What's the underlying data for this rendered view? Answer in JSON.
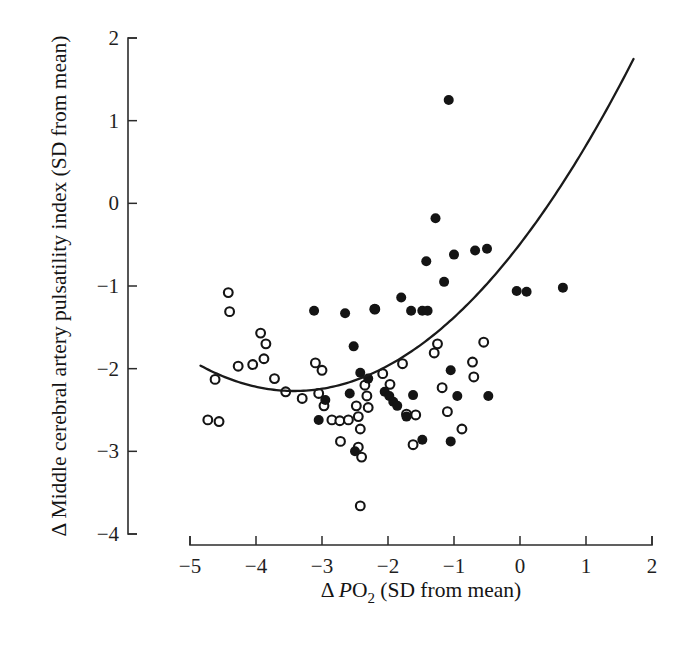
{
  "chart_data": {
    "type": "scatter",
    "title": "",
    "xlabel": "Δ PO2 (SD from mean)",
    "xlabel_parts": {
      "delta": "Δ",
      "italic": "P",
      "roman": "O",
      "sub": "2",
      "tail": " (SD from mean)"
    },
    "ylabel": "Δ Middle cerebral artery pulsatility index (SD from mean)",
    "xlim": [
      -5,
      2
    ],
    "ylim": [
      -4,
      2
    ],
    "xticks": [
      -5,
      -4,
      -3,
      -2,
      -1,
      0,
      1,
      2
    ],
    "xtick_labels": [
      "−5",
      "−4",
      "−3",
      "−2",
      "−1",
      "0",
      "1",
      "2"
    ],
    "yticks": [
      2,
      1,
      0,
      -1,
      -2,
      -3,
      -4
    ],
    "ytick_labels": [
      "2",
      "1",
      "0",
      "−1",
      "−2",
      "−3",
      "−4"
    ],
    "grid": false,
    "legend": false,
    "marker_colors": {
      "filled": "#141414",
      "open_fill": "#ffffff",
      "open_stroke": "#141414",
      "curve": "#1a1a1a",
      "axis": "#2b2b2b"
    },
    "series": [
      {
        "name": "open-circles",
        "marker": "open",
        "points": [
          [
            -4.42,
            -1.08
          ],
          [
            -4.4,
            -1.31
          ],
          [
            -3.93,
            -1.57
          ],
          [
            -3.85,
            -1.7
          ],
          [
            -3.88,
            -1.88
          ],
          [
            -4.27,
            -1.97
          ],
          [
            -4.05,
            -1.95
          ],
          [
            -3.72,
            -2.12
          ],
          [
            -3.55,
            -2.28
          ],
          [
            -4.62,
            -2.13
          ],
          [
            -3.3,
            -2.36
          ],
          [
            -4.73,
            -2.62
          ],
          [
            -4.56,
            -2.64
          ],
          [
            -3.1,
            -1.93
          ],
          [
            -3.0,
            -2.02
          ],
          [
            -3.05,
            -2.3
          ],
          [
            -2.97,
            -2.45
          ],
          [
            -2.85,
            -2.62
          ],
          [
            -2.73,
            -2.63
          ],
          [
            -2.6,
            -2.62
          ],
          [
            -2.48,
            -2.45
          ],
          [
            -2.45,
            -2.58
          ],
          [
            -2.42,
            -2.73
          ],
          [
            -2.35,
            -2.2
          ],
          [
            -2.32,
            -2.33
          ],
          [
            -2.3,
            -2.47
          ],
          [
            -2.72,
            -2.88
          ],
          [
            -2.45,
            -2.95
          ],
          [
            -2.4,
            -3.07
          ],
          [
            -2.42,
            -3.66
          ],
          [
            -2.2,
            -1.28
          ],
          [
            -2.08,
            -2.06
          ],
          [
            -1.97,
            -2.19
          ],
          [
            -1.78,
            -1.94
          ],
          [
            -1.72,
            -2.55
          ],
          [
            -1.58,
            -2.56
          ],
          [
            -1.62,
            -2.92
          ],
          [
            -1.3,
            -1.81
          ],
          [
            -1.25,
            -1.7
          ],
          [
            -1.18,
            -2.23
          ],
          [
            -1.1,
            -2.52
          ],
          [
            -0.88,
            -2.73
          ],
          [
            -0.72,
            -1.92
          ],
          [
            -0.7,
            -2.1
          ],
          [
            -0.55,
            -1.68
          ]
        ]
      },
      {
        "name": "filled-circles",
        "marker": "filled",
        "points": [
          [
            -1.08,
            1.25
          ],
          [
            -1.28,
            -0.18
          ],
          [
            -1.42,
            -0.7
          ],
          [
            -1.0,
            -0.62
          ],
          [
            -0.68,
            -0.57
          ],
          [
            -0.5,
            -0.55
          ],
          [
            -1.15,
            -0.95
          ],
          [
            -2.65,
            -1.33
          ],
          [
            -2.2,
            -1.28
          ],
          [
            -1.8,
            -1.14
          ],
          [
            -1.65,
            -1.3
          ],
          [
            -1.48,
            -1.3
          ],
          [
            -1.4,
            -1.3
          ],
          [
            -2.52,
            -1.73
          ],
          [
            -2.42,
            -2.05
          ],
          [
            -2.3,
            -2.12
          ],
          [
            -2.05,
            -2.28
          ],
          [
            -1.98,
            -2.33
          ],
          [
            -1.92,
            -2.4
          ],
          [
            -1.86,
            -2.45
          ],
          [
            -2.58,
            -2.3
          ],
          [
            -1.62,
            -2.32
          ],
          [
            -1.72,
            -2.58
          ],
          [
            -1.48,
            -2.86
          ],
          [
            -1.05,
            -2.02
          ],
          [
            -0.95,
            -2.33
          ],
          [
            -1.05,
            -2.88
          ],
          [
            -0.48,
            -2.33
          ],
          [
            -0.05,
            -1.06
          ],
          [
            0.1,
            -1.07
          ],
          [
            0.65,
            -1.02
          ],
          [
            -2.95,
            -2.38
          ],
          [
            -3.05,
            -2.62
          ],
          [
            -2.5,
            -3.0
          ],
          [
            -3.12,
            -1.3
          ]
        ]
      }
    ],
    "fit": {
      "name": "quadratic-fit",
      "vertex_x": -3.42,
      "vertex_y": -2.27,
      "a": 0.152,
      "x_start": -4.84,
      "x_end": 1.72
    }
  }
}
